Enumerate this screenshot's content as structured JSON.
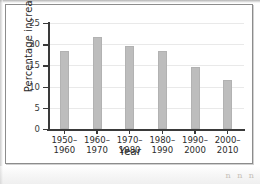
{
  "figure": {
    "background_color": "#ffffff",
    "border_color": "#8c8c8c",
    "bar_color": "#bdbdbd",
    "axis_color": "#3a3a3a",
    "gridline_color": "#e9e9e9",
    "scan_marks": "n n n"
  },
  "chart_data": {
    "type": "bar",
    "title": "",
    "xlabel": "Year",
    "ylabel": "Percentage increase",
    "categories": [
      "1950–\n1960",
      "1960–\n1970",
      "1970–\n1980",
      "1980–\n1990",
      "1990–\n2000",
      "2000–\n2010"
    ],
    "category_lines": [
      [
        "1950–",
        "1960"
      ],
      [
        "1960–",
        "1970"
      ],
      [
        "1970–",
        "1980"
      ],
      [
        "1980–",
        "1990"
      ],
      [
        "1990–",
        "2000"
      ],
      [
        "2000–",
        "2010"
      ]
    ],
    "values": [
      18.5,
      21.6,
      19.5,
      18.5,
      14.6,
      11.5
    ],
    "ylim": [
      0,
      25
    ],
    "yticks": [
      0,
      5,
      10,
      15,
      20,
      25
    ],
    "ytick_labels": [
      "0",
      "5",
      "10",
      "15",
      "20",
      "25"
    ],
    "grid": true,
    "grid_axis": "y",
    "legend": false,
    "legend_position": "none"
  }
}
